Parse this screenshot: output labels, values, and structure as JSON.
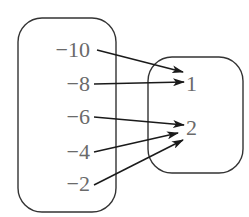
{
  "diagram": {
    "type": "mapping",
    "domain_set": {
      "name": "domain",
      "elements": [
        "−10",
        "−8",
        "−6",
        "−4",
        "−2"
      ]
    },
    "range_set": {
      "name": "range",
      "elements": [
        "1",
        "2"
      ]
    },
    "mappings": [
      {
        "from": "−10",
        "to": "1"
      },
      {
        "from": "−8",
        "to": "1"
      },
      {
        "from": "−6",
        "to": "2"
      },
      {
        "from": "−4",
        "to": "2"
      },
      {
        "from": "−2",
        "to": "2"
      }
    ],
    "colors": {
      "text": "#6a6a6a",
      "lines": "#1a1a1a",
      "box": "#333333",
      "background": "#ffffff"
    }
  }
}
